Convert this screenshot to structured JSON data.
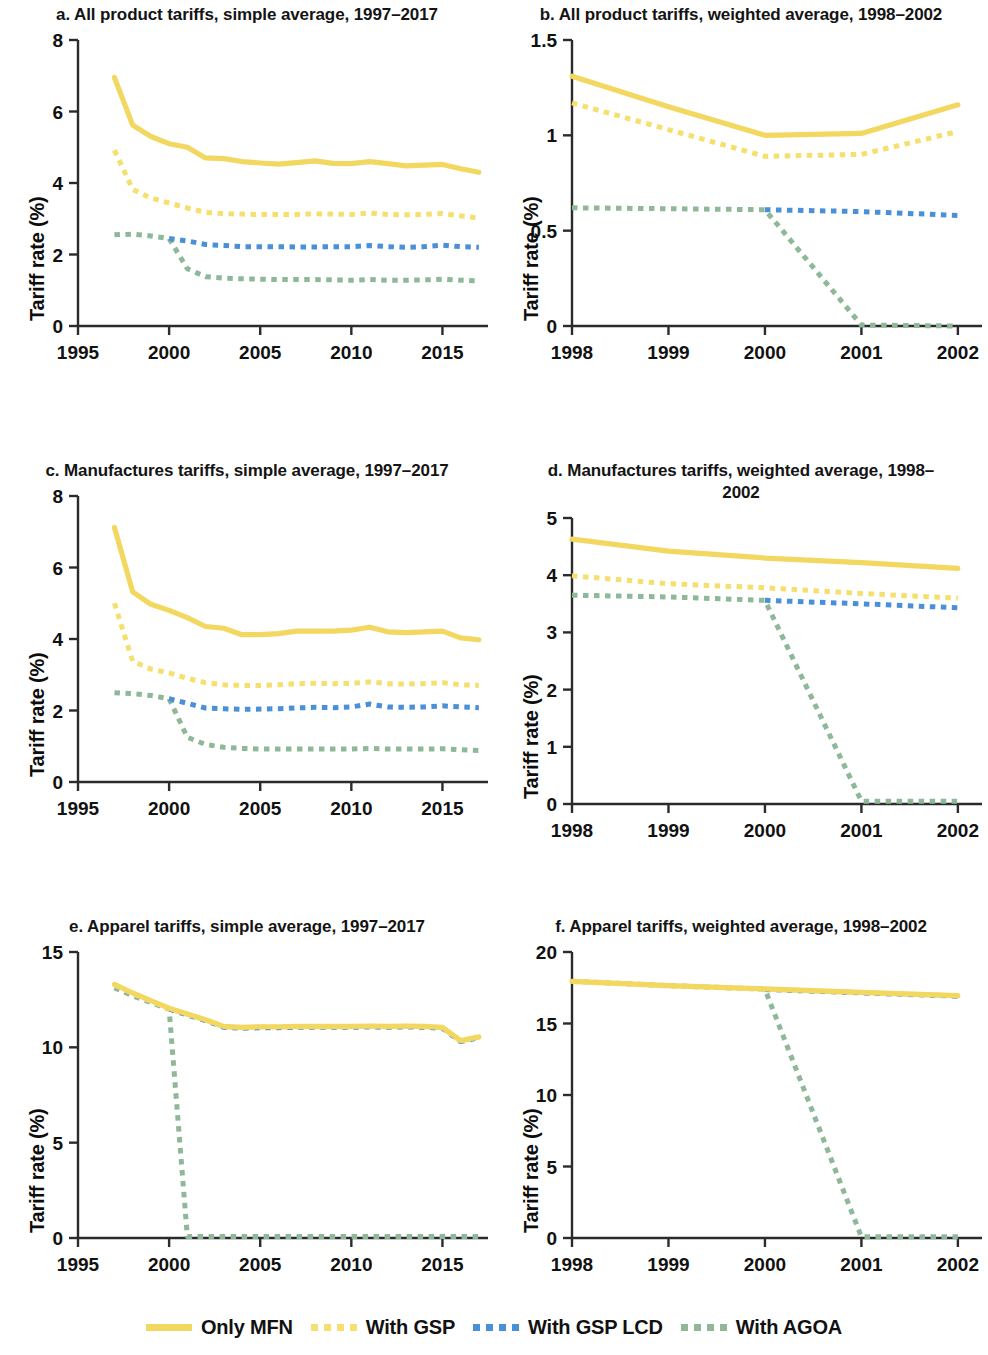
{
  "colors": {
    "mfn": "#F2D860",
    "gsp": "#F5DF6E",
    "gsp_lcd": "#4A90D9",
    "agoa": "#8FB898",
    "axis": "#2b2b2b",
    "text": "#111111"
  },
  "legend": {
    "items": [
      {
        "label": "Only MFN",
        "style": "solid",
        "color_key": "mfn",
        "swatch": "legend-swatch-mfn"
      },
      {
        "label": "With GSP",
        "style": "dashed",
        "color_key": "gsp",
        "swatch": "legend-swatch-gsp"
      },
      {
        "label": "With GSP LCD",
        "style": "dashed",
        "color_key": "gsp_lcd",
        "swatch": "legend-swatch-gsp-lcd"
      },
      {
        "label": "With AGOA",
        "style": "dashed",
        "color_key": "agoa",
        "swatch": "legend-swatch-agoa"
      }
    ]
  },
  "panels": {
    "a": {
      "title": "a. All product tariffs, simple average, 1997–2017",
      "ylabel": "Tariff rate (%)"
    },
    "b": {
      "title": "b. All product tariffs, weighted average, 1998–2002",
      "ylabel": "Tariff rate (%)"
    },
    "c": {
      "title": "c. Manufactures tariffs, simple average, 1997–2017",
      "ylabel": "Tariff rate (%)"
    },
    "d": {
      "title": "d. Manufactures tariffs, weighted average, 1998–2002",
      "ylabel": "Tariff rate (%)"
    },
    "e": {
      "title": "e. Apparel tariffs, simple average, 1997–2017",
      "ylabel": "Tariff rate (%)"
    },
    "f": {
      "title": "f. Apparel tariffs, weighted average, 1998–2002",
      "ylabel": "Tariff rate (%)"
    }
  },
  "chart_data": [
    {
      "id": "a",
      "type": "line",
      "title": "a. All product tariffs, simple average, 1997–2017",
      "xlabel": "",
      "ylabel": "Tariff rate (%)",
      "xlim": [
        1995,
        2017.5
      ],
      "ylim": [
        0,
        8
      ],
      "xticks": [
        1995,
        2000,
        2005,
        2010,
        2015
      ],
      "yticks": [
        0,
        2,
        4,
        6,
        8
      ],
      "grid": false,
      "legend_position": "bottom",
      "x": [
        1997,
        1998,
        1999,
        2000,
        2001,
        2002,
        2003,
        2004,
        2005,
        2006,
        2007,
        2008,
        2009,
        2010,
        2011,
        2012,
        2013,
        2014,
        2015,
        2016,
        2017
      ],
      "series": [
        {
          "name": "Only MFN",
          "style": "solid",
          "color": "#F2D860",
          "values": [
            6.95,
            5.62,
            5.3,
            5.1,
            5.0,
            4.7,
            4.68,
            4.6,
            4.56,
            4.53,
            4.57,
            4.62,
            4.55,
            4.54,
            4.6,
            4.54,
            4.48,
            4.5,
            4.52,
            4.4,
            4.3
          ]
        },
        {
          "name": "With GSP",
          "style": "dashed",
          "color": "#F5DF6E",
          "values": [
            4.92,
            3.82,
            3.58,
            3.44,
            3.3,
            3.18,
            3.14,
            3.13,
            3.12,
            3.12,
            3.12,
            3.14,
            3.13,
            3.12,
            3.16,
            3.12,
            3.11,
            3.12,
            3.15,
            3.08,
            3.02
          ]
        },
        {
          "name": "With GSP LCD",
          "style": "dashed",
          "color": "#4A90D9",
          "values": [
            null,
            null,
            null,
            2.45,
            2.38,
            2.28,
            2.25,
            2.22,
            2.22,
            2.22,
            2.21,
            2.21,
            2.22,
            2.22,
            2.25,
            2.22,
            2.2,
            2.22,
            2.26,
            2.22,
            2.2
          ]
        },
        {
          "name": "With AGOA",
          "style": "dashed",
          "color": "#8FB898",
          "values": [
            2.55,
            2.57,
            2.52,
            2.45,
            1.6,
            1.38,
            1.34,
            1.32,
            1.31,
            1.3,
            1.3,
            1.3,
            1.29,
            1.28,
            1.3,
            1.28,
            1.28,
            1.29,
            1.31,
            1.28,
            1.26
          ]
        }
      ]
    },
    {
      "id": "b",
      "type": "line",
      "title": "b. All product tariffs, weighted average, 1998–2002",
      "xlabel": "",
      "ylabel": "Tariff rate (%)",
      "xlim": [
        1998,
        2002.25
      ],
      "ylim": [
        0,
        1.5
      ],
      "xticks": [
        1998,
        1999,
        2000,
        2001,
        2002
      ],
      "yticks": [
        0,
        0.5,
        1.0,
        1.5
      ],
      "grid": false,
      "legend_position": "bottom",
      "x": [
        1998,
        1999,
        2000,
        2001,
        2002
      ],
      "series": [
        {
          "name": "Only MFN",
          "style": "solid",
          "color": "#F2D860",
          "values": [
            1.31,
            1.15,
            1.0,
            1.01,
            1.16
          ]
        },
        {
          "name": "With GSP",
          "style": "dashed",
          "color": "#F5DF6E",
          "values": [
            1.17,
            1.03,
            0.89,
            0.9,
            1.02
          ]
        },
        {
          "name": "With GSP LCD",
          "style": "dashed",
          "color": "#4A90D9",
          "values": [
            null,
            null,
            0.61,
            0.6,
            0.58
          ]
        },
        {
          "name": "With AGOA",
          "style": "dashed",
          "color": "#8FB898",
          "values": [
            0.62,
            0.615,
            0.61,
            0.005,
            0.0
          ]
        }
      ]
    },
    {
      "id": "c",
      "type": "line",
      "title": "c. Manufactures tariffs, simple average, 1997–2017",
      "xlabel": "",
      "ylabel": "Tariff rate (%)",
      "xlim": [
        1995,
        2017.5
      ],
      "ylim": [
        0,
        8
      ],
      "xticks": [
        1995,
        2000,
        2005,
        2010,
        2015
      ],
      "yticks": [
        0,
        2,
        4,
        6,
        8
      ],
      "grid": false,
      "legend_position": "bottom",
      "x": [
        1997,
        1998,
        1999,
        2000,
        2001,
        2002,
        2003,
        2004,
        2005,
        2006,
        2007,
        2008,
        2009,
        2010,
        2011,
        2012,
        2013,
        2014,
        2015,
        2016,
        2017
      ],
      "series": [
        {
          "name": "Only MFN",
          "style": "solid",
          "color": "#F2D860",
          "values": [
            7.12,
            5.32,
            4.97,
            4.8,
            4.6,
            4.35,
            4.3,
            4.12,
            4.12,
            4.15,
            4.22,
            4.22,
            4.22,
            4.25,
            4.33,
            4.2,
            4.18,
            4.2,
            4.22,
            4.03,
            3.98
          ]
        },
        {
          "name": "With GSP",
          "style": "dashed",
          "color": "#F5DF6E",
          "values": [
            5.0,
            3.38,
            3.16,
            3.05,
            2.9,
            2.78,
            2.72,
            2.7,
            2.7,
            2.72,
            2.75,
            2.76,
            2.75,
            2.76,
            2.8,
            2.75,
            2.74,
            2.75,
            2.78,
            2.72,
            2.7
          ]
        },
        {
          "name": "With GSP LCD",
          "style": "dashed",
          "color": "#4A90D9",
          "values": [
            null,
            null,
            null,
            2.33,
            2.2,
            2.07,
            2.05,
            2.03,
            2.04,
            2.05,
            2.07,
            2.09,
            2.08,
            2.1,
            2.18,
            2.1,
            2.09,
            2.1,
            2.13,
            2.1,
            2.08
          ]
        },
        {
          "name": "With AGOA",
          "style": "dashed",
          "color": "#8FB898",
          "values": [
            2.5,
            2.47,
            2.42,
            2.33,
            1.25,
            1.05,
            0.97,
            0.94,
            0.92,
            0.92,
            0.92,
            0.92,
            0.92,
            0.92,
            0.94,
            0.92,
            0.92,
            0.92,
            0.93,
            0.9,
            0.88
          ]
        }
      ]
    },
    {
      "id": "d",
      "type": "line",
      "title": "d. Manufactures tariffs, weighted average, 1998–2002",
      "xlabel": "",
      "ylabel": "Tariff rate (%)",
      "xlim": [
        1998,
        2002.25
      ],
      "ylim": [
        0,
        5
      ],
      "xticks": [
        1998,
        1999,
        2000,
        2001,
        2002
      ],
      "yticks": [
        0,
        1,
        2,
        3,
        4,
        5
      ],
      "grid": false,
      "legend_position": "bottom",
      "x": [
        1998,
        1999,
        2000,
        2001,
        2002
      ],
      "series": [
        {
          "name": "Only MFN",
          "style": "solid",
          "color": "#F2D860",
          "values": [
            4.63,
            4.42,
            4.3,
            4.22,
            4.12
          ]
        },
        {
          "name": "With GSP",
          "style": "dashed",
          "color": "#F5DF6E",
          "values": [
            3.99,
            3.85,
            3.78,
            3.68,
            3.6
          ]
        },
        {
          "name": "With GSP LCD",
          "style": "dashed",
          "color": "#4A90D9",
          "values": [
            null,
            null,
            3.56,
            3.5,
            3.43
          ]
        },
        {
          "name": "With AGOA",
          "style": "dashed",
          "color": "#8FB898",
          "values": [
            3.65,
            3.62,
            3.56,
            0.05,
            0.05
          ]
        }
      ]
    },
    {
      "id": "e",
      "type": "line",
      "title": "e. Apparel tariffs, simple average, 1997–2017",
      "xlabel": "",
      "ylabel": "Tariff rate (%)",
      "xlim": [
        1995,
        2017.5
      ],
      "ylim": [
        0,
        15
      ],
      "xticks": [
        1995,
        2000,
        2005,
        2010,
        2015
      ],
      "yticks": [
        0,
        5,
        10,
        15
      ],
      "grid": false,
      "legend_position": "bottom",
      "x": [
        1997,
        1998,
        1999,
        2000,
        2001,
        2002,
        2003,
        2004,
        2005,
        2006,
        2007,
        2008,
        2009,
        2010,
        2011,
        2012,
        2013,
        2014,
        2015,
        2016,
        2017
      ],
      "series": [
        {
          "name": "Only MFN",
          "style": "solid",
          "color": "#F2D860",
          "values": [
            13.3,
            12.85,
            12.45,
            12.05,
            11.75,
            11.45,
            11.1,
            11.05,
            11.08,
            11.08,
            11.1,
            11.1,
            11.1,
            11.1,
            11.12,
            11.1,
            11.12,
            11.1,
            11.05,
            10.35,
            10.55
          ]
        },
        {
          "name": "With GSP",
          "style": "dashed",
          "color": "#F5DF6E",
          "values": [
            13.28,
            12.83,
            12.43,
            12.03,
            11.73,
            11.43,
            11.08,
            11.03,
            11.06,
            11.06,
            11.08,
            11.08,
            11.08,
            11.08,
            11.1,
            11.08,
            11.1,
            11.08,
            11.03,
            10.33,
            10.53
          ]
        },
        {
          "name": "With GSP LCD",
          "style": "dashed",
          "color": "#4A90D9",
          "values": [
            null,
            null,
            null,
            12.0,
            11.7,
            11.4,
            11.05,
            11.0,
            11.03,
            11.03,
            11.05,
            11.05,
            11.05,
            11.05,
            11.07,
            11.05,
            11.07,
            11.05,
            11.0,
            10.3,
            10.5
          ]
        },
        {
          "name": "With AGOA",
          "style": "dashed",
          "color": "#8FB898",
          "values": [
            13.12,
            12.7,
            12.35,
            12.0,
            0.08,
            0.08,
            0.08,
            0.08,
            0.08,
            0.08,
            0.08,
            0.08,
            0.08,
            0.08,
            0.08,
            0.08,
            0.08,
            0.08,
            0.08,
            0.08,
            0.08
          ]
        }
      ]
    },
    {
      "id": "f",
      "type": "line",
      "title": "f. Apparel tariffs, weighted average, 1998–2002",
      "xlabel": "",
      "ylabel": "Tariff rate (%)",
      "xlim": [
        1998,
        2002.25
      ],
      "ylim": [
        0,
        20
      ],
      "xticks": [
        1998,
        1999,
        2000,
        2001,
        2002
      ],
      "yticks": [
        0,
        5,
        10,
        15,
        20
      ],
      "grid": false,
      "legend_position": "bottom",
      "x": [
        1998,
        1999,
        2000,
        2001,
        2002
      ],
      "series": [
        {
          "name": "Only MFN",
          "style": "solid",
          "color": "#F2D860",
          "values": [
            17.95,
            17.65,
            17.42,
            17.18,
            16.95
          ]
        },
        {
          "name": "With GSP",
          "style": "dashed",
          "color": "#F5DF6E",
          "values": [
            17.93,
            17.63,
            17.4,
            17.16,
            16.93
          ]
        },
        {
          "name": "With GSP LCD",
          "style": "dashed",
          "color": "#4A90D9",
          "values": [
            null,
            null,
            17.38,
            17.14,
            16.91
          ]
        },
        {
          "name": "With AGOA",
          "style": "dashed",
          "color": "#8FB898",
          "values": [
            17.95,
            17.65,
            17.4,
            0.08,
            0.08
          ]
        }
      ]
    }
  ]
}
